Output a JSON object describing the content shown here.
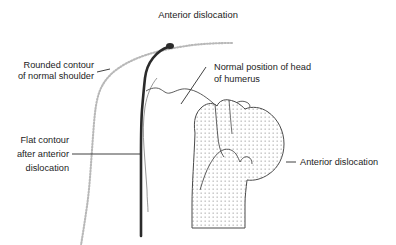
{
  "figure": {
    "title": "Anterior dislocation",
    "background_color": "#ffffff",
    "labels": {
      "title": "Anterior dislocation",
      "rounded_contour_line1": "Rounded contour",
      "rounded_contour_line2": "of normal shoulder",
      "flat_contour_line1": "Flat contour",
      "flat_contour_line2": "after anterior",
      "flat_contour_line3": "dislocation",
      "normal_position_line1": "Normal position of head",
      "normal_position_line2": "of humerus",
      "anterior_dislocation_right": "Anterior dislocation"
    },
    "colors": {
      "text": "#1c1c1c",
      "dotted_contour": "#b8b8b8",
      "flat_contour": "#2b2b2b",
      "bone_outline": "#4a4a4a",
      "stipple_dot": "#9a9a9a",
      "leader_line": "#2b2b2b"
    },
    "elements": {
      "dotted_shoulder_contour": "light-gray stippled curve of rounded normal shoulder silhouette",
      "flat_shoulder_contour": "dark heavy vertical line showing flattened deltoid contour",
      "humeral_head": "stippled bone shape displaced anteriorly",
      "glenoid_outline": "thin outline marking normal position of humeral head",
      "hook_arrow": "small curved hook at superior humeral head"
    }
  }
}
